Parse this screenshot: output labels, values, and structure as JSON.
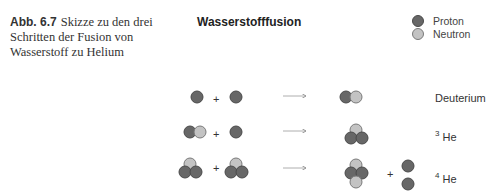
{
  "caption": {
    "label": "Abb. 6.7",
    "text": "Skizze zu den drei Schritten der Fusion von Wasserstoff zu Helium"
  },
  "diagram": {
    "title": "Wasserstofffusion",
    "legend": [
      {
        "label": "Proton",
        "color": "#676767",
        "stroke": "#4a4a4a"
      },
      {
        "label": "Neutron",
        "color": "#c3c3c3",
        "stroke": "#7a7a7a"
      }
    ],
    "reactions": [
      {
        "reactants": [
          "p",
          "p"
        ],
        "product": "Deuterium",
        "product_mass": "",
        "product_symbol": "Deuterium",
        "byproducts": []
      },
      {
        "reactants": [
          "Deuterium",
          "p"
        ],
        "product": "3 He",
        "product_mass": "3",
        "product_symbol": "He",
        "byproducts": []
      },
      {
        "reactants": [
          "3 He",
          "3 He"
        ],
        "product": "4 He",
        "product_mass": "4",
        "product_symbol": "He",
        "byproducts": [
          "p",
          "p"
        ]
      }
    ],
    "plus_sign": "+"
  }
}
